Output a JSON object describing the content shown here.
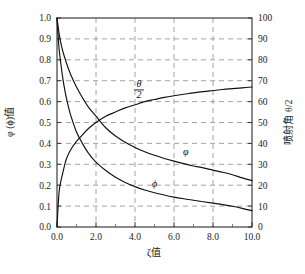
{
  "chart_data": {
    "type": "line",
    "title": "",
    "xlabel": "ζ值",
    "ylabel": "φ (ϕ)值",
    "y2label": "喷射角 θ/2",
    "xlim": [
      0.0,
      10.0
    ],
    "ylim": [
      0.0,
      1.0
    ],
    "y2lim": [
      0,
      100
    ],
    "grid": true,
    "legend_position": "inline-annotations",
    "xticks": [
      "0.0",
      "2.0",
      "4.0",
      "6.0",
      "8.0",
      "10.0"
    ],
    "xtick_values": [
      0.0,
      2.0,
      4.0,
      6.0,
      8.0,
      10.0
    ],
    "yticks": [
      "0.0",
      "0.1",
      "0.2",
      "0.3",
      "0.4",
      "0.5",
      "0.6",
      "0.7",
      "0.8",
      "0.9",
      "1.0"
    ],
    "ytick_values": [
      0.0,
      0.1,
      0.2,
      0.3,
      0.4,
      0.5,
      0.6,
      0.7,
      0.8,
      0.9,
      1.0
    ],
    "y2ticks": [
      "0",
      "10",
      "20",
      "30",
      "40",
      "50",
      "60",
      "70",
      "80",
      "90",
      "100"
    ],
    "y2tick_values": [
      0,
      10,
      20,
      30,
      40,
      50,
      60,
      70,
      80,
      90,
      100
    ],
    "x": [
      0.0,
      0.1,
      0.2,
      0.3,
      0.4,
      0.5,
      0.7,
      1.0,
      1.3,
      1.6,
      2.0,
      2.5,
      3.0,
      3.5,
      4.0,
      4.5,
      5.0,
      5.5,
      6.0,
      6.5,
      7.0,
      7.5,
      8.0,
      8.5,
      9.0,
      9.5,
      10.0
    ],
    "series": [
      {
        "name": "θ/2",
        "label": "θ/2",
        "axis": "right",
        "values": [
          0,
          16,
          22,
          26,
          30,
          33,
          37,
          41,
          44,
          47,
          50,
          53,
          55,
          57,
          58.5,
          60,
          61,
          62,
          62.8,
          63.5,
          64.2,
          64.8,
          65.3,
          65.8,
          66.2,
          66.6,
          67.0
        ],
        "label_x": 4.2,
        "label_y": 62
      },
      {
        "name": "φ",
        "label": "φ",
        "axis": "left",
        "values": [
          1.0,
          0.93,
          0.88,
          0.84,
          0.81,
          0.78,
          0.73,
          0.67,
          0.62,
          0.575,
          0.53,
          0.475,
          0.435,
          0.405,
          0.38,
          0.36,
          0.343,
          0.328,
          0.315,
          0.303,
          0.292,
          0.283,
          0.272,
          0.262,
          0.25,
          0.235,
          0.222
        ],
        "label_x": 6.6,
        "label_y": 0.345
      },
      {
        "name": "ϕ",
        "label": "ϕ",
        "axis": "left",
        "values": [
          1.0,
          0.86,
          0.78,
          0.71,
          0.655,
          0.61,
          0.535,
          0.455,
          0.4,
          0.355,
          0.31,
          0.27,
          0.238,
          0.213,
          0.193,
          0.177,
          0.164,
          0.153,
          0.143,
          0.135,
          0.128,
          0.121,
          0.114,
          0.107,
          0.099,
          0.089,
          0.078
        ],
        "label_x": 5.0,
        "label_y": 0.19
      }
    ]
  }
}
